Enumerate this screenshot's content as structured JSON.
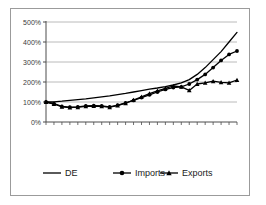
{
  "figure": {
    "background_color": "#ffffff",
    "border_color": "#9b9b9b",
    "axis_color": "#4d4d4d",
    "gridline_color": "#a8a8a8",
    "series_color": "#000000"
  },
  "chart_data": {
    "type": "line",
    "title": "",
    "subtitle": "",
    "xlabel": "",
    "ylabel": "",
    "ylim": [
      0,
      500
    ],
    "yticks": [
      0,
      100,
      200,
      300,
      400,
      500
    ],
    "ytick_labels": [
      "0%",
      "100%",
      "200%",
      "300%",
      "400%",
      "500%"
    ],
    "xlim": [
      0,
      24
    ],
    "xtick_count": 25,
    "xtick_labels": [],
    "grid": "horizontal",
    "legend_position": "bottom",
    "x": [
      0,
      1,
      2,
      3,
      4,
      5,
      6,
      7,
      8,
      9,
      10,
      11,
      12,
      13,
      14,
      15,
      16,
      17,
      18,
      19,
      20,
      21,
      22,
      23,
      24
    ],
    "series": [
      {
        "name": "DE",
        "marker": "none",
        "line_style": "solid",
        "color": "#000000",
        "values": [
          100,
          101,
          104,
          108,
          112,
          116,
          121,
          126,
          131,
          137,
          143,
          150,
          157,
          164,
          170,
          177,
          185,
          196,
          212,
          238,
          272,
          312,
          352,
          400,
          448
        ]
      },
      {
        "name": "Imports",
        "marker": "circle",
        "line_style": "solid",
        "color": "#000000",
        "values": [
          100,
          92,
          78,
          74,
          76,
          80,
          82,
          80,
          76,
          84,
          95,
          108,
          122,
          136,
          150,
          163,
          172,
          176,
          190,
          212,
          238,
          272,
          308,
          338,
          355
        ]
      },
      {
        "name": "Exports",
        "marker": "triangle",
        "line_style": "solid",
        "color": "#000000",
        "values": [
          100,
          90,
          76,
          72,
          74,
          78,
          80,
          78,
          74,
          82,
          94,
          110,
          126,
          142,
          156,
          168,
          180,
          176,
          158,
          190,
          196,
          204,
          198,
          196,
          210
        ]
      }
    ]
  },
  "legend": {
    "items": [
      {
        "label": "DE",
        "marker": "none"
      },
      {
        "label": "Imports",
        "marker": "circle"
      },
      {
        "label": "Exports",
        "marker": "triangle"
      }
    ]
  }
}
